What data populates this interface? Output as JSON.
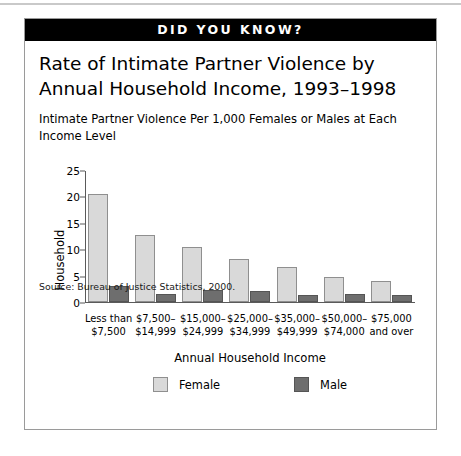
{
  "banner": {
    "label": "DID YOU KNOW?"
  },
  "card": {
    "title": "Rate of Intimate Partner Violence by Annual Household Income, 1993–1998",
    "subtitle": "Intimate Partner Violence Per 1,000 Females or Males at Each Income Level",
    "source": "Source:  Bureau of Justice Statistics, 2000."
  },
  "chart_data": {
    "type": "bar",
    "title": "Rate of Intimate Partner Violence by Annual Household Income, 1993–1998",
    "subtitle": "Intimate Partner Violence Per 1,000 Females or Males at Each Income Level",
    "xlabel": "Annual Household Income",
    "ylabel": "Household",
    "ylim": [
      0,
      25
    ],
    "yticks": [
      0,
      5,
      10,
      15,
      20,
      25
    ],
    "grid": false,
    "legend_position": "bottom",
    "categories": [
      "Less than\n$7,500",
      "$7,500–\n$14,999",
      "$15,000–\n$24,999",
      "$25,000–\n$34,999",
      "$35,000–\n$49,999",
      "$50,000–\n$74,000",
      "$75,000\nand over"
    ],
    "series": [
      {
        "name": "Female",
        "color": "#d9d9d9",
        "values": [
          20.5,
          12.7,
          10.5,
          8.1,
          6.7,
          4.7,
          3.9
        ]
      },
      {
        "name": "Male",
        "color": "#6e6e6e",
        "values": [
          3.0,
          1.5,
          2.3,
          2.1,
          1.4,
          1.5,
          1.3
        ]
      }
    ]
  }
}
